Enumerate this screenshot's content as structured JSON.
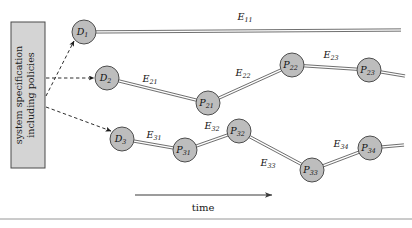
{
  "figure": {
    "background_color": "#ffffff",
    "node_fill": "#bdbdbd",
    "node_stroke": "#4d4d4d",
    "edge_color": "#555555",
    "dashed_color": "#222222",
    "box_fill": "#d4d4d4",
    "box_stroke": "#4a4a4a"
  },
  "spec_box": {
    "line1": "system specification",
    "line2": "including policies",
    "x": 11,
    "y": 22,
    "width": 34,
    "height": 146
  },
  "axis": {
    "label": "time",
    "arrow_x1": 135,
    "arrow_x2": 272,
    "arrow_y": 195,
    "label_x": 203,
    "label_y": 211
  },
  "bottom_rule": {
    "y": 219
  },
  "nodes": [
    {
      "id": "D1",
      "base": "D",
      "sub": "1",
      "x": 84,
      "y": 32,
      "r": 12
    },
    {
      "id": "D2",
      "base": "D",
      "sub": "2",
      "x": 107,
      "y": 78,
      "r": 12
    },
    {
      "id": "D3",
      "base": "D",
      "sub": "3",
      "x": 122,
      "y": 139,
      "r": 12
    },
    {
      "id": "P21",
      "base": "P",
      "sub": "21",
      "x": 208,
      "y": 103,
      "r": 12
    },
    {
      "id": "P22",
      "base": "P",
      "sub": "22",
      "x": 292,
      "y": 65,
      "r": 12
    },
    {
      "id": "P23",
      "base": "P",
      "sub": "23",
      "x": 369,
      "y": 70,
      "r": 12
    },
    {
      "id": "P31",
      "base": "P",
      "sub": "31",
      "x": 185,
      "y": 150,
      "r": 12
    },
    {
      "id": "P32",
      "base": "P",
      "sub": "32",
      "x": 239,
      "y": 131,
      "r": 12
    },
    {
      "id": "P33",
      "base": "P",
      "sub": "33",
      "x": 312,
      "y": 170,
      "r": 12
    },
    {
      "id": "P34",
      "base": "P",
      "sub": "34",
      "x": 370,
      "y": 148,
      "r": 12
    }
  ],
  "edges": [
    {
      "id": "E11",
      "base": "E",
      "sub": "11",
      "from": "D1",
      "to_x": 401,
      "to_y": 30,
      "label_x": 245,
      "label_y": 20
    },
    {
      "id": "E21",
      "base": "E",
      "sub": "21",
      "from": "D2",
      "to": "P21",
      "label_x": 150,
      "label_y": 82
    },
    {
      "id": "E22",
      "base": "E",
      "sub": "22",
      "from": "P21",
      "to": "P22",
      "label_x": 243,
      "label_y": 76
    },
    {
      "id": "E23",
      "base": "E",
      "sub": "23",
      "from": "P22",
      "to": "P23",
      "label_x": 331,
      "label_y": 58
    },
    {
      "id": "E24",
      "base": "",
      "sub": "",
      "from": "P23",
      "to_x": 405,
      "to_y": 76,
      "label_x": 0,
      "label_y": 0
    },
    {
      "id": "E31",
      "base": "E",
      "sub": "31",
      "from": "D3",
      "to": "P31",
      "label_x": 154,
      "label_y": 138
    },
    {
      "id": "E32",
      "base": "E",
      "sub": "32",
      "from": "P31",
      "to": "P32",
      "label_x": 212,
      "label_y": 129
    },
    {
      "id": "E33",
      "base": "E",
      "sub": "33",
      "from": "P32",
      "to": "P33",
      "label_x": 268,
      "label_y": 166
    },
    {
      "id": "E34",
      "base": "E",
      "sub": "34",
      "from": "P33",
      "to": "P34",
      "label_x": 341,
      "label_y": 147
    },
    {
      "id": "E35",
      "base": "",
      "sub": "",
      "from": "P34",
      "to_x": 404,
      "to_y": 145,
      "label_x": 0,
      "label_y": 0
    }
  ],
  "dashed_arrows": [
    {
      "id": "spec-to-D1",
      "from_x": 46,
      "from_y": 96,
      "to_x": 74,
      "to_y": 41
    },
    {
      "id": "spec-to-D2",
      "from_x": 46,
      "from_y": 78,
      "to_x": 94,
      "to_y": 78
    },
    {
      "id": "spec-to-D3",
      "from_x": 46,
      "from_y": 107,
      "to_x": 111,
      "to_y": 131
    }
  ]
}
